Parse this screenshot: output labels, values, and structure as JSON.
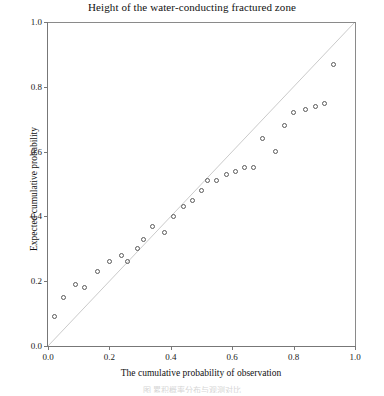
{
  "chart_data": {
    "type": "scatter",
    "title": "Height of the water-conducting fractured zone",
    "xlabel": "The cumulative probability of observation",
    "ylabel": "Expected cumulative probability",
    "xlim": [
      0.0,
      1.0
    ],
    "ylim": [
      0.0,
      1.0
    ],
    "xticks": [
      "0.0",
      "0.2",
      "0.4",
      "0.6",
      "0.8",
      "1.0"
    ],
    "yticks": [
      "0.0",
      "0.2",
      "0.4",
      "0.6",
      "0.8",
      "1.0"
    ],
    "xtick_values": [
      0.0,
      0.2,
      0.4,
      0.6,
      0.8,
      1.0
    ],
    "ytick_values": [
      0.0,
      0.2,
      0.4,
      0.6,
      0.8,
      1.0
    ],
    "grid": false,
    "legend": false,
    "reference_line": {
      "name": "identity-line",
      "from": [
        0.0,
        0.0
      ],
      "to": [
        1.0,
        1.0
      ]
    },
    "marker": "open-circle",
    "series": [
      {
        "name": "Q-Q points",
        "x": [
          0.02,
          0.05,
          0.09,
          0.12,
          0.16,
          0.2,
          0.24,
          0.26,
          0.29,
          0.31,
          0.34,
          0.38,
          0.41,
          0.44,
          0.47,
          0.5,
          0.52,
          0.55,
          0.58,
          0.61,
          0.64,
          0.67,
          0.7,
          0.74,
          0.77,
          0.8,
          0.84,
          0.87,
          0.9,
          0.93
        ],
        "y": [
          0.09,
          0.15,
          0.19,
          0.18,
          0.23,
          0.26,
          0.28,
          0.26,
          0.3,
          0.33,
          0.37,
          0.35,
          0.4,
          0.43,
          0.45,
          0.48,
          0.51,
          0.51,
          0.53,
          0.54,
          0.55,
          0.55,
          0.64,
          0.6,
          0.68,
          0.72,
          0.73,
          0.74,
          0.75,
          0.87
        ]
      }
    ]
  },
  "caption": {
    "text": "图    累积概率分布与观测对比"
  }
}
